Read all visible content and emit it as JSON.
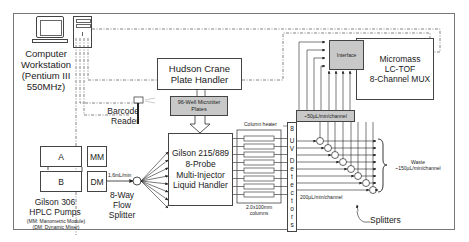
{
  "diagram": {
    "computer": {
      "label_lines": [
        "Computer",
        "Workstation",
        "(Pentium III",
        "550MHz)"
      ]
    },
    "plate_handler": {
      "label_lines": [
        "Hudson Crane",
        "Plate Handler"
      ]
    },
    "plates": {
      "label_lines": [
        "96-Well Microtiter",
        "Plates"
      ]
    },
    "barcode_reader": {
      "label_lines": [
        "Barcode",
        "Reader"
      ]
    },
    "pumps": {
      "pump_a": "A",
      "pump_b": "B",
      "mm": "MM",
      "dm": "DM",
      "label_lines": [
        "Gilson 306",
        "HPLC Pumps"
      ],
      "legend_lines": [
        "(MM:  Manometric Module)",
        "(DM:  Dynamic Mixer)"
      ]
    },
    "flow_rate": "1.6mL/min",
    "flow_splitter": {
      "label_lines": [
        "8-Way",
        "Flow",
        "Splitter"
      ]
    },
    "liquid_handler": {
      "label_lines": [
        "Gilson 215/889",
        "8-Probe",
        "Multi-Injector",
        "Liquid Handler"
      ]
    },
    "columns": {
      "label_lines": [
        "2.0x100mm",
        "columns"
      ],
      "count": 8
    },
    "column_heater": "Column heater",
    "uv_detectors": {
      "letters": [
        "8",
        "",
        "U",
        "V",
        "",
        "D",
        "e",
        "t",
        "e",
        "c",
        "t",
        "o",
        "r",
        "s"
      ]
    },
    "channel_flow": "200µL/min/channel",
    "ms": {
      "interface": "Interface",
      "label_lines": [
        "Micromass",
        "LC-TOF",
        "8-Channel MUX"
      ],
      "ms_flow": "~50µL/min/channel"
    },
    "waste": {
      "label_lines": [
        "Waste",
        "~150µL/min/channel"
      ]
    },
    "splitters": "Splitters"
  }
}
